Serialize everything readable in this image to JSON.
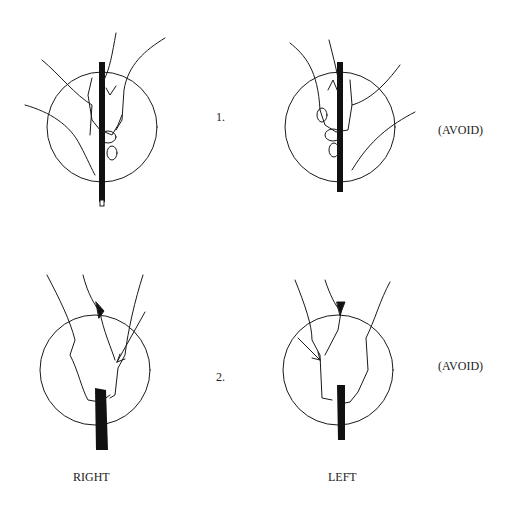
{
  "panels": [
    {
      "row": 1,
      "number_label": "1.",
      "right_grip_label": "",
      "left_grip_label": "(AVOID)"
    },
    {
      "row": 2,
      "number_label": "2.",
      "right_grip_label": "",
      "left_grip_label": "(AVOID)"
    }
  ],
  "columns": {
    "left_column_label": "RIGHT",
    "right_column_label": "LEFT"
  },
  "colors": {
    "ink": "#1a1a1a",
    "background": "#ffffff"
  }
}
